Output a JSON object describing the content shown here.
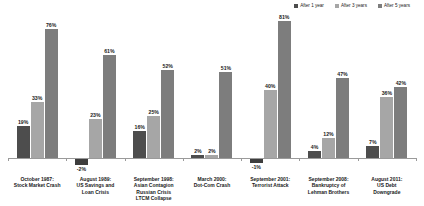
{
  "legend": {
    "position": "top-right",
    "items": [
      {
        "label": "After 1 year",
        "color": "#4d4d4d",
        "icon": "square-swatch-icon"
      },
      {
        "label": "After 3 years",
        "color": "#a6a6a6",
        "icon": "square-swatch-icon"
      },
      {
        "label": "After 5 years",
        "color": "#7d7d7d",
        "icon": "square-swatch-icon"
      }
    ]
  },
  "chart_data": {
    "type": "bar",
    "title": "",
    "subtitle": "",
    "xlabel": "",
    "ylabel": "",
    "grid": false,
    "legend_position": "top-right",
    "ylim": [
      -5,
      85
    ],
    "categories": [
      "October 1987:\nStock Market Crash",
      "August 1989:\nUS Savings and\nLoan Crisis",
      "September 1998:\nAsian Contagion\nRussian Crisis\nLTCM Collapse",
      "March 2000:\nDot-Com Crash",
      "September 2001:\nTerrorist Attack",
      "September 2008:\nBankruptcy of\nLehman Brothers",
      "August 2011:\nUS Debt\nDowngrade"
    ],
    "category_lines": [
      [
        "October 1987:",
        "Stock Market Crash"
      ],
      [
        "August 1989:",
        "US Savings and",
        "Loan Crisis"
      ],
      [
        "September 1998:",
        "Asian Contagion",
        "Russian Crisis",
        "LTCM Collapse"
      ],
      [
        "March 2000:",
        "Dot-Com Crash"
      ],
      [
        "September 2001:",
        "Terrorist Attack"
      ],
      [
        "September 2008:",
        "Bankruptcy of",
        "Lehman Brothers"
      ],
      [
        "August 2011:",
        "US Debt",
        "Downgrade"
      ]
    ],
    "series": [
      {
        "name": "After 1 year",
        "color": "#4d4d4d",
        "values": [
          19,
          -2,
          16,
          2,
          -1,
          4,
          7
        ]
      },
      {
        "name": "After 3 years",
        "color": "#a6a6a6",
        "values": [
          33,
          23,
          25,
          2,
          40,
          12,
          36
        ]
      },
      {
        "name": "After 5 years",
        "color": "#7d7d7d",
        "values": [
          76,
          61,
          52,
          51,
          81,
          47,
          42
        ]
      }
    ],
    "value_labels": [
      [
        "19%",
        "33%",
        "76%"
      ],
      [
        "-2%",
        "23%",
        "61%"
      ],
      [
        "16%",
        "25%",
        "52%"
      ],
      [
        "2%",
        "2%",
        "51%"
      ],
      [
        "-1%",
        "40%",
        "81%"
      ],
      [
        "4%",
        "12%",
        "47%"
      ],
      [
        "7%",
        "36%",
        "42%"
      ]
    ]
  }
}
